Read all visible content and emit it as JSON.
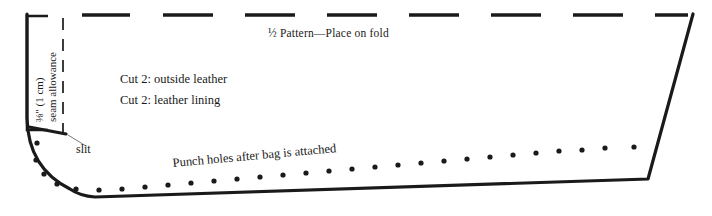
{
  "diagram": {
    "background_color": "#ffffff",
    "line_color": "#1a1a1a",
    "labels": {
      "fold_line": "½ Pattern—Place on fold",
      "cut_outside": "Cut 2: outside leather",
      "cut_lining": "Cut 2: leather lining",
      "slit": "slit",
      "punch_holes": "Punch holes after bag is attached",
      "seam_allowance_measure": "⅜\" (1 cm)",
      "seam_allowance_text": "seam allowance"
    },
    "fold_dashes": [
      {
        "x1": 82,
        "x2": 130
      },
      {
        "x1": 163,
        "x2": 213
      },
      {
        "x1": 245,
        "x2": 295
      },
      {
        "x1": 327,
        "x2": 377
      },
      {
        "x1": 409,
        "x2": 459
      },
      {
        "x1": 491,
        "x2": 541
      },
      {
        "x1": 573,
        "x2": 623
      },
      {
        "x1": 655,
        "x2": 688
      }
    ],
    "seam_dashes": [
      {
        "y1": 18,
        "y2": 30
      },
      {
        "y1": 39,
        "y2": 51
      },
      {
        "y1": 60,
        "y2": 72
      },
      {
        "y1": 81,
        "y2": 93
      },
      {
        "y1": 102,
        "y2": 114
      },
      {
        "y1": 123,
        "y2": 132
      }
    ],
    "punch_holes": [
      {
        "cx": 37,
        "cy": 143,
        "r": 2.6
      },
      {
        "cx": 36,
        "cy": 160,
        "r": 2.6
      },
      {
        "cx": 44,
        "cy": 174,
        "r": 2.6
      },
      {
        "cx": 57,
        "cy": 184,
        "r": 2.6
      },
      {
        "cx": 76,
        "cy": 189,
        "r": 2.6
      },
      {
        "cx": 99,
        "cy": 190,
        "r": 2.6
      },
      {
        "cx": 122,
        "cy": 189,
        "r": 2.6
      },
      {
        "cx": 145,
        "cy": 187,
        "r": 2.6
      },
      {
        "cx": 168,
        "cy": 185,
        "r": 2.6
      },
      {
        "cx": 191,
        "cy": 183,
        "r": 2.6
      },
      {
        "cx": 214,
        "cy": 181,
        "r": 2.6
      },
      {
        "cx": 237,
        "cy": 179,
        "r": 2.6
      },
      {
        "cx": 260,
        "cy": 177,
        "r": 2.6
      },
      {
        "cx": 283,
        "cy": 175,
        "r": 2.6
      },
      {
        "cx": 306,
        "cy": 173,
        "r": 2.6
      },
      {
        "cx": 329,
        "cy": 171,
        "r": 2.6
      },
      {
        "cx": 352,
        "cy": 169,
        "r": 2.6
      },
      {
        "cx": 375,
        "cy": 167,
        "r": 2.6
      },
      {
        "cx": 398,
        "cy": 165,
        "r": 2.6
      },
      {
        "cx": 421,
        "cy": 163,
        "r": 2.6
      },
      {
        "cx": 444,
        "cy": 161,
        "r": 2.6
      },
      {
        "cx": 467,
        "cy": 159,
        "r": 2.6
      },
      {
        "cx": 490,
        "cy": 157,
        "r": 2.6
      },
      {
        "cx": 513,
        "cy": 155,
        "r": 2.6
      },
      {
        "cx": 536,
        "cy": 153,
        "r": 2.6
      },
      {
        "cx": 559,
        "cy": 151,
        "r": 2.6
      },
      {
        "cx": 582,
        "cy": 150,
        "r": 2.6
      },
      {
        "cx": 605,
        "cy": 148,
        "r": 2.6
      },
      {
        "cx": 634,
        "cy": 147,
        "r": 2.6
      }
    ],
    "outline_path": "M 27 14 L 27 119 Q 27 175 84 196 L 662 196 L 662 196",
    "body_outline": "M 27 14 L 27 118 Q 28 168 70 189 Q 80 196 95 197 L 648 179 L 693 14",
    "bracket_path": "M 48 16 L 27 16 L 27 130 L 48 130",
    "slit_mark": "M 29 127 L 66 134",
    "slit_leader": "M 68 135 L 86 146",
    "fold_y": 15,
    "seam_line_x": 63
  }
}
